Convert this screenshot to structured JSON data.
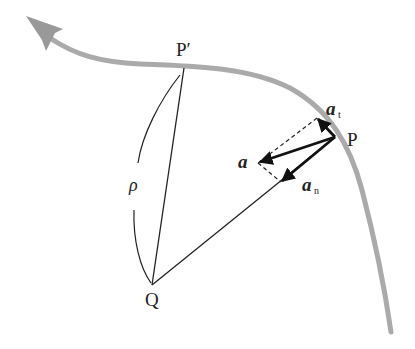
{
  "diagram": {
    "points": {
      "P": {
        "label": "P",
        "x": 335,
        "y": 137
      },
      "P_prime": {
        "label": "P′",
        "x": 184,
        "y": 68
      },
      "Q": {
        "label": "Q",
        "x": 152,
        "y": 285
      }
    },
    "labels": {
      "rho": "ρ",
      "a": "a",
      "a_t": "a",
      "a_t_sub": "t",
      "a_n": "a",
      "a_n_sub": "n"
    },
    "colors": {
      "path": "#aaaaaa",
      "lines": "#222222",
      "vectors": "#111111",
      "background": "#ffffff"
    },
    "vectors": [
      {
        "name": "a",
        "from": [
          335,
          137
        ],
        "to": [
          258,
          163
        ]
      },
      {
        "name": "a_t",
        "from": [
          335,
          137
        ],
        "to": [
          317,
          118
        ]
      },
      {
        "name": "a_n",
        "from": [
          335,
          137
        ],
        "to": [
          281,
          182
        ]
      }
    ]
  }
}
